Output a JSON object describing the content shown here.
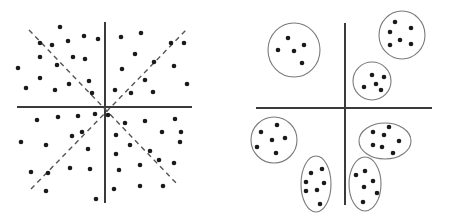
{
  "diagram": {
    "type": "scatter-comparison",
    "colors": {
      "dot": "#1a1a1a",
      "axis": "#3a3a3a",
      "dashed": "#555555",
      "ellipse": "#7a7a7a",
      "background": "#ffffff"
    },
    "left_panel": {
      "description": "Uniformly scattered points divided by axes and two dashed diagonals",
      "axes": {
        "vertical": {
          "x": 105,
          "y1": 22,
          "y2": 203
        },
        "horizontal": {
          "y": 107,
          "x1": 17,
          "x2": 192
        }
      },
      "dashed_lines": [
        {
          "x1": 29,
          "y1": 30,
          "x2": 178,
          "y2": 185
        },
        {
          "x1": 31,
          "y1": 189,
          "x2": 187,
          "y2": 29
        }
      ],
      "points": [
        [
          60,
          27
        ],
        [
          84,
          36
        ],
        [
          98,
          39
        ],
        [
          40,
          43
        ],
        [
          52,
          45
        ],
        [
          68,
          41
        ],
        [
          40,
          57
        ],
        [
          57,
          65
        ],
        [
          73,
          57
        ],
        [
          85,
          59
        ],
        [
          18,
          68
        ],
        [
          40,
          78
        ],
        [
          26,
          88
        ],
        [
          55,
          90
        ],
        [
          69,
          84
        ],
        [
          89,
          81
        ],
        [
          92,
          93
        ],
        [
          121,
          37
        ],
        [
          141,
          33
        ],
        [
          171,
          43
        ],
        [
          184,
          43
        ],
        [
          135,
          54
        ],
        [
          122,
          69
        ],
        [
          154,
          62
        ],
        [
          174,
          66
        ],
        [
          145,
          80
        ],
        [
          187,
          84
        ],
        [
          115,
          90
        ],
        [
          131,
          93
        ],
        [
          153,
          92
        ],
        [
          37,
          120
        ],
        [
          58,
          117
        ],
        [
          78,
          116
        ],
        [
          95,
          114
        ],
        [
          72,
          136
        ],
        [
          82,
          132
        ],
        [
          21,
          142
        ],
        [
          46,
          145
        ],
        [
          88,
          149
        ],
        [
          31,
          172
        ],
        [
          48,
          173
        ],
        [
          70,
          168
        ],
        [
          90,
          169
        ],
        [
          46,
          191
        ],
        [
          96,
          199
        ],
        [
          108,
          115
        ],
        [
          125,
          123
        ],
        [
          145,
          121
        ],
        [
          175,
          119
        ],
        [
          116,
          135
        ],
        [
          130,
          145
        ],
        [
          162,
          132
        ],
        [
          181,
          132
        ],
        [
          150,
          151
        ],
        [
          116,
          154
        ],
        [
          180,
          142
        ],
        [
          159,
          160
        ],
        [
          174,
          163
        ],
        [
          119,
          170
        ],
        [
          140,
          165
        ],
        [
          114,
          189
        ],
        [
          140,
          186
        ],
        [
          163,
          186
        ]
      ]
    },
    "right_panel": {
      "description": "Points grouped into seven clusters, each enclosed in an ellipse",
      "axes": {
        "vertical": {
          "x": 345,
          "y1": 23,
          "y2": 205
        },
        "horizontal": {
          "y": 108,
          "x1": 256,
          "x2": 432
        }
      },
      "clusters": [
        {
          "name": "upper-left",
          "cx": 294,
          "cy": 50,
          "rx": 26,
          "ry": 27,
          "points": [
            [
              288,
              38
            ],
            [
              304,
              45
            ],
            [
              278,
              50
            ],
            [
              294,
              51
            ],
            [
              302,
              63
            ]
          ]
        },
        {
          "name": "upper-right",
          "cx": 402,
          "cy": 35,
          "rx": 23,
          "ry": 24,
          "points": [
            [
              395,
              22
            ],
            [
              390,
              32
            ],
            [
              411,
              28
            ],
            [
              400,
              40
            ],
            [
              390,
              45
            ],
            [
              411,
              44
            ]
          ]
        },
        {
          "name": "center-right",
          "cx": 372,
          "cy": 81,
          "rx": 19,
          "ry": 19,
          "points": [
            [
              372,
              75
            ],
            [
              384,
              77
            ],
            [
              376,
              84
            ],
            [
              364,
              87
            ],
            [
              381,
              90
            ]
          ]
        },
        {
          "name": "lower-left",
          "cx": 274,
          "cy": 140,
          "rx": 23,
          "ry": 23,
          "points": [
            [
              277,
              125
            ],
            [
              261,
              132
            ],
            [
              272,
              140
            ],
            [
              285,
              138
            ],
            [
              257,
              147
            ],
            [
              276,
              153
            ]
          ]
        },
        {
          "name": "lower-right",
          "cx": 385,
          "cy": 141,
          "rx": 26,
          "ry": 18,
          "points": [
            [
              389,
              127
            ],
            [
              373,
              132
            ],
            [
              384,
              135
            ],
            [
              399,
              141
            ],
            [
              373,
              145
            ],
            [
              382,
              147
            ],
            [
              393,
              153
            ]
          ]
        },
        {
          "name": "bottom-center",
          "cx": 316,
          "cy": 184,
          "rx": 15,
          "ry": 28,
          "points": [
            [
              311,
              173
            ],
            [
              322,
              169
            ],
            [
              306,
              182
            ],
            [
              324,
              183
            ],
            [
              306,
              191
            ],
            [
              317,
              190
            ],
            [
              320,
              204
            ]
          ]
        },
        {
          "name": "bottom-right",
          "cx": 365,
          "cy": 184,
          "rx": 16,
          "ry": 27,
          "points": [
            [
              356,
              175
            ],
            [
              365,
              171
            ],
            [
              373,
              181
            ],
            [
              364,
              187
            ],
            [
              377,
              193
            ],
            [
              363,
              202
            ]
          ]
        }
      ]
    }
  }
}
